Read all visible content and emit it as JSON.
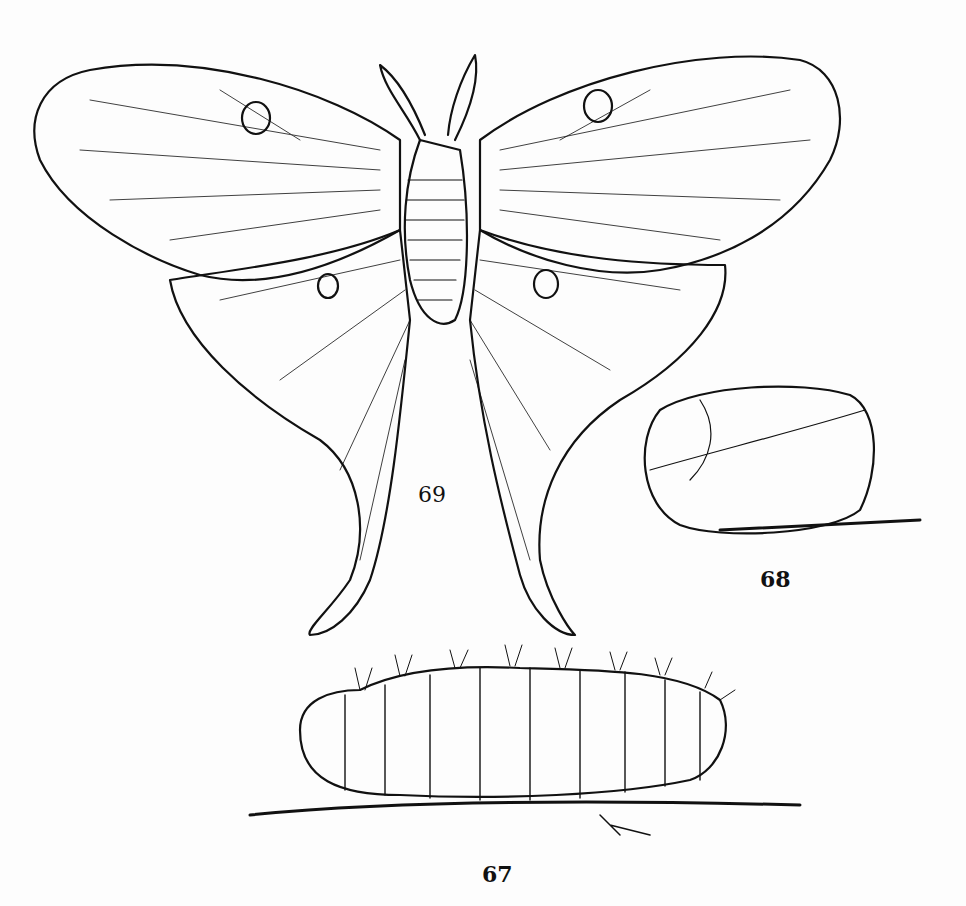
{
  "figures": {
    "moth": {
      "label": "69",
      "subject": "luna moth (adult)"
    },
    "cocoon": {
      "label": "68",
      "subject": "cocoon"
    },
    "caterpillar": {
      "label": "67",
      "subject": "caterpillar on twig"
    }
  },
  "colors": {
    "ink": "#111111",
    "paper": "#fdfdfd"
  }
}
